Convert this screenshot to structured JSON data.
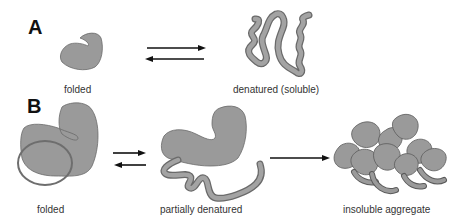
{
  "panels": {
    "a": {
      "label": "A",
      "states": [
        {
          "name": "folded",
          "label": "folded"
        },
        {
          "name": "denatured-soluble",
          "label": "denatured (soluble)"
        }
      ],
      "transition": "reversible"
    },
    "b": {
      "label": "B",
      "states": [
        {
          "name": "folded",
          "label": "folded"
        },
        {
          "name": "partially-denatured",
          "label": "partially denatured"
        },
        {
          "name": "insoluble-aggregate",
          "label": "insoluble aggregate"
        }
      ],
      "transitions": [
        "reversible",
        "irreversible"
      ]
    }
  },
  "colors": {
    "protein_fill": "#9a9a9a",
    "protein_stroke": "#6a6a6a",
    "circle_stroke": "#6e6e6e",
    "arrow": "#111111"
  }
}
